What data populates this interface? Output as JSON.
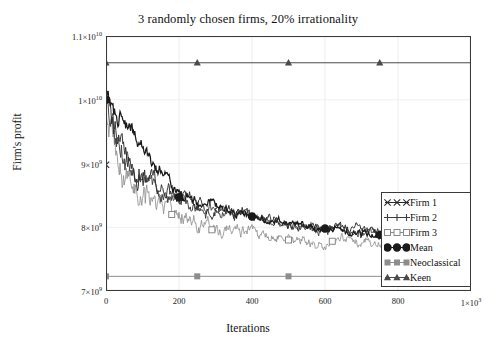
{
  "chart_data": {
    "type": "line",
    "title": "3 randomly chosen firms, 20% irrationality",
    "xlabel": "Iterations",
    "ylabel": "Firm's profit",
    "xlim": [
      0,
      1000
    ],
    "ylim": [
      7000000000,
      11000000000
    ],
    "grid": true,
    "legend_position": "lower-right-inside",
    "xticks": [
      {
        "value": 0,
        "label": "0"
      },
      {
        "value": 200,
        "label": "200"
      },
      {
        "value": 400,
        "label": "400"
      },
      {
        "value": 600,
        "label": "600"
      },
      {
        "value": 800,
        "label": "800"
      },
      {
        "value": 1000,
        "label": "1×10",
        "exp": "3"
      }
    ],
    "yticks": [
      {
        "value": 11000000000,
        "label": "1.1×10",
        "exp": "10"
      },
      {
        "value": 10000000000,
        "label": "1×10",
        "exp": "10"
      },
      {
        "value": 9000000000,
        "label": "9×10",
        "exp": "9"
      },
      {
        "value": 8000000000,
        "label": "8×10",
        "exp": "9"
      },
      {
        "value": 7000000000,
        "label": "7×10",
        "exp": "9"
      }
    ],
    "series": [
      {
        "name": "Firm 1",
        "marker": "x",
        "color": "#2b2b2b",
        "kind": "noisy-decay",
        "x": [
          0,
          10,
          25,
          50,
          75,
          100,
          125,
          150,
          175,
          200,
          250,
          300,
          350,
          400,
          450,
          500,
          550,
          600,
          650,
          700,
          750,
          800,
          850,
          900,
          950,
          1000
        ],
        "values": [
          10000000000,
          9820000000,
          9540000000,
          9200000000,
          9000000000,
          8860000000,
          8760000000,
          8640000000,
          8560000000,
          8470000000,
          8360000000,
          8300000000,
          8260000000,
          8180000000,
          8120000000,
          8070000000,
          8030000000,
          7990000000,
          8000000000,
          7950000000,
          7900000000,
          7880000000,
          7860000000,
          7850000000,
          7830000000,
          7830000000
        ]
      },
      {
        "name": "Firm 2",
        "marker": "plus",
        "color": "#3d3d3d",
        "kind": "noisy-decay",
        "x": [
          0,
          10,
          25,
          50,
          75,
          100,
          125,
          150,
          175,
          200,
          250,
          300,
          350,
          400,
          450,
          500,
          550,
          600,
          650,
          700,
          750,
          800,
          850,
          900,
          950,
          1000
        ],
        "values": [
          10000000000,
          9760000000,
          9460000000,
          9120000000,
          8930000000,
          8800000000,
          8700000000,
          8580000000,
          8500000000,
          8430000000,
          8320000000,
          8250000000,
          8220000000,
          8150000000,
          8090000000,
          8040000000,
          8000000000,
          7960000000,
          7970000000,
          7920000000,
          7880000000,
          7850000000,
          7840000000,
          7830000000,
          7810000000,
          7810000000
        ]
      },
      {
        "name": "Firm 3",
        "marker": "square-open",
        "color": "#8a8a8a",
        "kind": "noisy-decay-low",
        "x": [
          0,
          10,
          25,
          50,
          75,
          100,
          125,
          150,
          175,
          200,
          250,
          300,
          350,
          400,
          450,
          500,
          550,
          600,
          650,
          700,
          750,
          800,
          850,
          900,
          950,
          1000
        ],
        "values": [
          10000000000,
          9500000000,
          9100000000,
          8760000000,
          8560000000,
          8480000000,
          8440000000,
          8380000000,
          8300000000,
          8200000000,
          8070000000,
          7980000000,
          7940000000,
          7900000000,
          7830000000,
          7800000000,
          7790000000,
          7780000000,
          7800000000,
          7740000000,
          7720000000,
          7700000000,
          7700000000,
          7690000000,
          7680000000,
          7680000000
        ]
      },
      {
        "name": "Mean",
        "marker": "circle-filled",
        "color": "#1a1a1a",
        "kind": "noisy-decay",
        "x": [
          0,
          200,
          400,
          600,
          750
        ],
        "values": [
          10000000000,
          8470000000,
          8170000000,
          7980000000,
          7880000000
        ]
      },
      {
        "name": "Neoclassical",
        "marker": "square-filled",
        "color": "#8d8d8d",
        "kind": "constant",
        "x": [
          0,
          250,
          500,
          1000
        ],
        "values": [
          7230000000,
          7230000000,
          7230000000,
          7230000000
        ]
      },
      {
        "name": "Keen",
        "marker": "triangle-filled",
        "color": "#4a4a4a",
        "kind": "constant",
        "x": [
          0,
          250,
          500,
          750,
          1000
        ],
        "values": [
          10580000000,
          10580000000,
          10580000000,
          10580000000,
          10580000000
        ]
      }
    ]
  },
  "legend": {
    "items": [
      {
        "label": "Firm 1",
        "icon": "x-marker-icon"
      },
      {
        "label": "Firm 2",
        "icon": "plus-marker-icon"
      },
      {
        "label": "Firm 3",
        "icon": "square-open-marker-icon"
      },
      {
        "label": "Mean",
        "icon": "circle-filled-marker-icon"
      },
      {
        "label": "Neoclassical",
        "icon": "square-filled-marker-icon"
      },
      {
        "label": "Keen",
        "icon": "triangle-filled-marker-icon"
      }
    ]
  }
}
